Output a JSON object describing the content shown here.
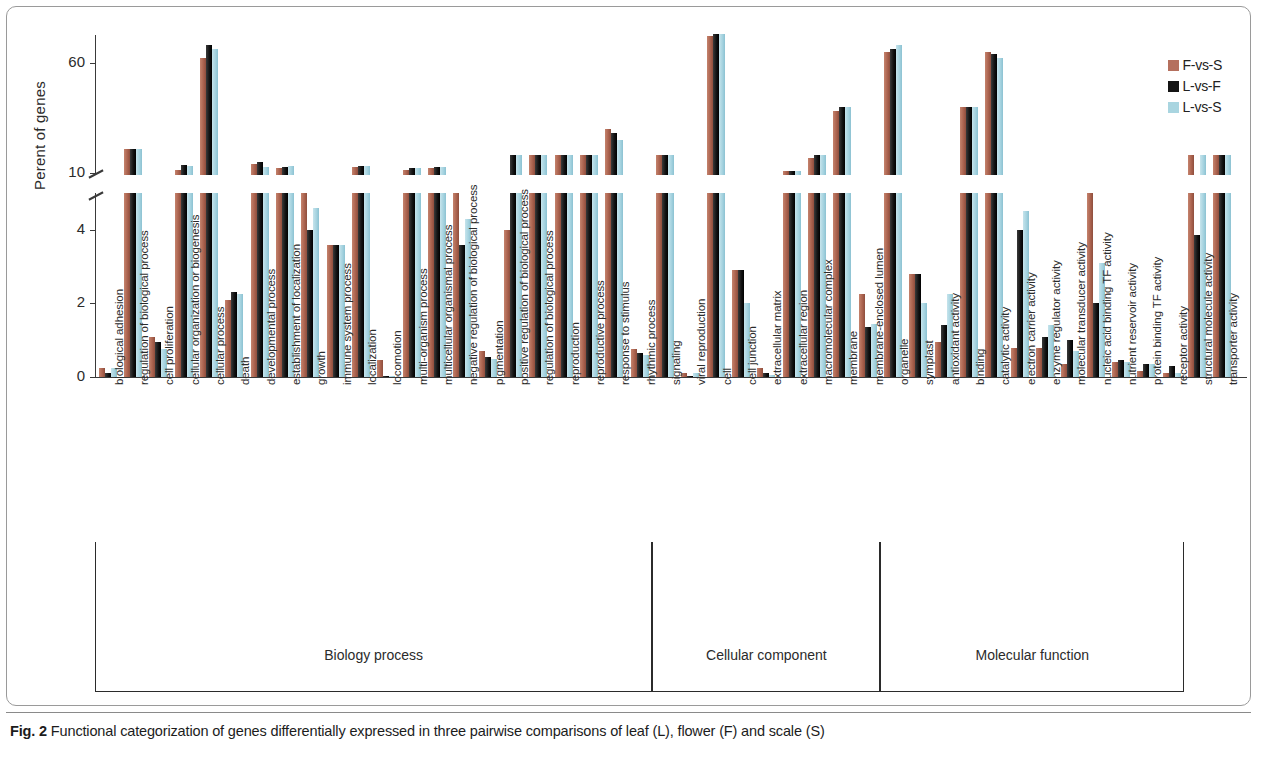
{
  "figure": {
    "label": "Fig. 2",
    "caption": "Functional categorization of genes differentially expressed in three pairwise comparisons of leaf (L), flower (F) and scale (S)"
  },
  "legend": {
    "position": "top-right",
    "entries": [
      {
        "label": "F-vs-S",
        "color": "#b5705e"
      },
      {
        "label": "L-vs-F",
        "color": "#141414"
      },
      {
        "label": "L-vs-S",
        "color": "#a9d5e0"
      }
    ]
  },
  "groups": [
    {
      "name": "Biology process",
      "count": 22
    },
    {
      "name": "Cellular component",
      "count": 9
    },
    {
      "name": "Molecular function",
      "count": 12
    }
  ],
  "axis": {
    "ylabel": "Perent of genes",
    "lower_ticks": [
      "0",
      "2",
      "4"
    ],
    "upper_ticks": [
      "10",
      "60"
    ],
    "broken": true
  },
  "chart_data": {
    "type": "bar",
    "title": "",
    "xlabel": "",
    "ylabel": "Perent of genes",
    "ylim": [
      0,
      75
    ],
    "y_break": [
      5,
      9
    ],
    "grid": false,
    "legend_position": "top-right",
    "categories": [
      "biological adhesion",
      "regulation of biological process",
      "cell proliferation",
      "cellular organization or biogenesis",
      "cellular process",
      "death",
      "developmental process",
      "establishment of localization",
      "growth",
      "immune system process",
      "localization",
      "locomotion",
      "multi-organism process",
      "multicellular organismal process",
      "negative regulation of biological process",
      "pigmentation",
      "positive regulation of biological process",
      "regulation of biological process",
      "reproduction",
      "reproductive process",
      "response to stimulus",
      "rhythmic process",
      "signaling",
      "viral reproduction",
      "cell",
      "cell junction",
      "extracellular matrix",
      "extracellular region",
      "macromolecular complex",
      "membrane",
      "membrane-enclosed lumen",
      "organelle",
      "symplast",
      "antioxidant activity",
      "binding",
      "catalytic activity",
      "electron carrier activity",
      "enzyme regulator activity",
      "molecular transducer activity",
      "nucleic acid binding TF activity",
      "nutrient reservoir activity",
      "protein binding TF activity",
      "receptor activity",
      "structural molecule activity",
      "transporter activity"
    ],
    "series": [
      {
        "name": "F-vs-S",
        "color": "#b5705e",
        "values": [
          0.25,
          21,
          1.1,
          11.5,
          62,
          2.1,
          14,
          12,
          5.2,
          3.6,
          12.5,
          0.45,
          11.5,
          12,
          5.2,
          0.7,
          4.0,
          18,
          18,
          18,
          30,
          0.75,
          18,
          0.1,
          72,
          2.9,
          0.25,
          11.0,
          16.5,
          38,
          2.25,
          65,
          2.8,
          0.95,
          40,
          65,
          0.8,
          0.8,
          0.35,
          8.5,
          0.4,
          0.15,
          0.1,
          18,
          18
        ]
      },
      {
        "name": "L-vs-F",
        "color": "#141414",
        "values": [
          0.1,
          21,
          0.95,
          13.5,
          68,
          2.3,
          15,
          12.5,
          4.0,
          3.6,
          13,
          0.02,
          12,
          12.5,
          3.6,
          0.55,
          18,
          18,
          18,
          18,
          28,
          0.65,
          18,
          0.04,
          73,
          2.9,
          0.1,
          11.0,
          18,
          40,
          1.35,
          66,
          2.8,
          1.4,
          40,
          64,
          4.0,
          1.1,
          1.0,
          2.0,
          0.45,
          0.35,
          0.3,
          3.85,
          18
        ]
      },
      {
        "name": "L-vs-S",
        "color": "#a9d5e0",
        "values": [
          0.25,
          21,
          0.75,
          13,
          66,
          2.25,
          12.5,
          13,
          4.6,
          3.6,
          13,
          0.02,
          12,
          12.5,
          4.3,
          0.5,
          18,
          18,
          18,
          18,
          25,
          0.6,
          18,
          0.12,
          73,
          2.0,
          0.05,
          11.0,
          18,
          40,
          1.45,
          68,
          2.0,
          2.25,
          40,
          62,
          4.5,
          1.4,
          0.7,
          3.1,
          0.4,
          0.35,
          0.1,
          18,
          18
        ]
      }
    ]
  }
}
